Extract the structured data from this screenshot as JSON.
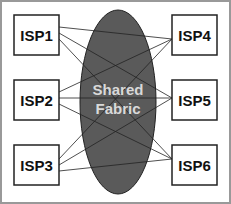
{
  "diagram": {
    "fabric_label_line1": "Shared",
    "fabric_label_line2": "Fabric",
    "colors": {
      "fabric": "#5a5a5a",
      "frame": "#999999",
      "box_stroke": "#222222"
    },
    "nodes": [
      {
        "id": "isp1",
        "label": "ISP1",
        "side": "left"
      },
      {
        "id": "isp2",
        "label": "ISP2",
        "side": "left"
      },
      {
        "id": "isp3",
        "label": "ISP3",
        "side": "left"
      },
      {
        "id": "isp4",
        "label": "ISP4",
        "side": "right"
      },
      {
        "id": "isp5",
        "label": "ISP5",
        "side": "right"
      },
      {
        "id": "isp6",
        "label": "ISP6",
        "side": "right"
      }
    ],
    "links": [
      [
        "isp1",
        "isp4"
      ],
      [
        "isp1",
        "isp5"
      ],
      [
        "isp1",
        "isp6"
      ],
      [
        "isp2",
        "isp4"
      ],
      [
        "isp2",
        "isp5"
      ],
      [
        "isp2",
        "isp6"
      ],
      [
        "isp3",
        "isp4"
      ],
      [
        "isp3",
        "isp5"
      ],
      [
        "isp3",
        "isp6"
      ]
    ]
  }
}
